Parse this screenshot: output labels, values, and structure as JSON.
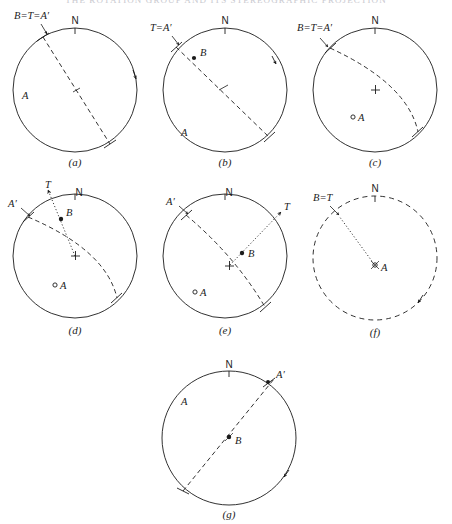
{
  "header": {
    "running_text": "THE ROTATION GROUP AND ITS STEREOGRAPHIC PROJECTION"
  },
  "figure": {
    "panels": [
      {
        "id": "a",
        "caption": "(a)",
        "north_label": "N",
        "labels": [
          {
            "name": "B=T=A'",
            "text": "B=T=A′"
          },
          {
            "name": "A",
            "text": "A"
          }
        ]
      },
      {
        "id": "b",
        "caption": "(b)",
        "north_label": "N",
        "labels": [
          {
            "name": "T=A'",
            "text": "T=A′"
          },
          {
            "name": "B",
            "text": "B"
          },
          {
            "name": "A",
            "text": "A"
          }
        ]
      },
      {
        "id": "c",
        "caption": "(c)",
        "north_label": "N",
        "labels": [
          {
            "name": "B=T=A'",
            "text": "B=T=A′"
          },
          {
            "name": "A",
            "text": "A"
          }
        ]
      },
      {
        "id": "d",
        "caption": "(d)",
        "north_label": "N",
        "labels": [
          {
            "name": "T",
            "text": "T"
          },
          {
            "name": "A'",
            "text": "A′"
          },
          {
            "name": "B",
            "text": "B"
          },
          {
            "name": "A",
            "text": "A"
          }
        ]
      },
      {
        "id": "e",
        "caption": "(e)",
        "north_label": "N",
        "labels": [
          {
            "name": "A'",
            "text": "A′"
          },
          {
            "name": "T",
            "text": "T"
          },
          {
            "name": "B",
            "text": "B"
          },
          {
            "name": "A",
            "text": "A"
          }
        ]
      },
      {
        "id": "f",
        "caption": "(f)",
        "north_label": "N",
        "labels": [
          {
            "name": "B=T",
            "text": "B=T"
          },
          {
            "name": "A",
            "text": "A"
          }
        ]
      },
      {
        "id": "g",
        "caption": "(g)",
        "north_label": "N",
        "labels": [
          {
            "name": "A'",
            "text": "A′"
          },
          {
            "name": "A",
            "text": "A"
          },
          {
            "name": "B",
            "text": "B"
          }
        ]
      }
    ],
    "colors": {
      "ink": "#1b1b1b",
      "paper": "#ffffff",
      "faded_header": "#c9c9cf"
    }
  }
}
